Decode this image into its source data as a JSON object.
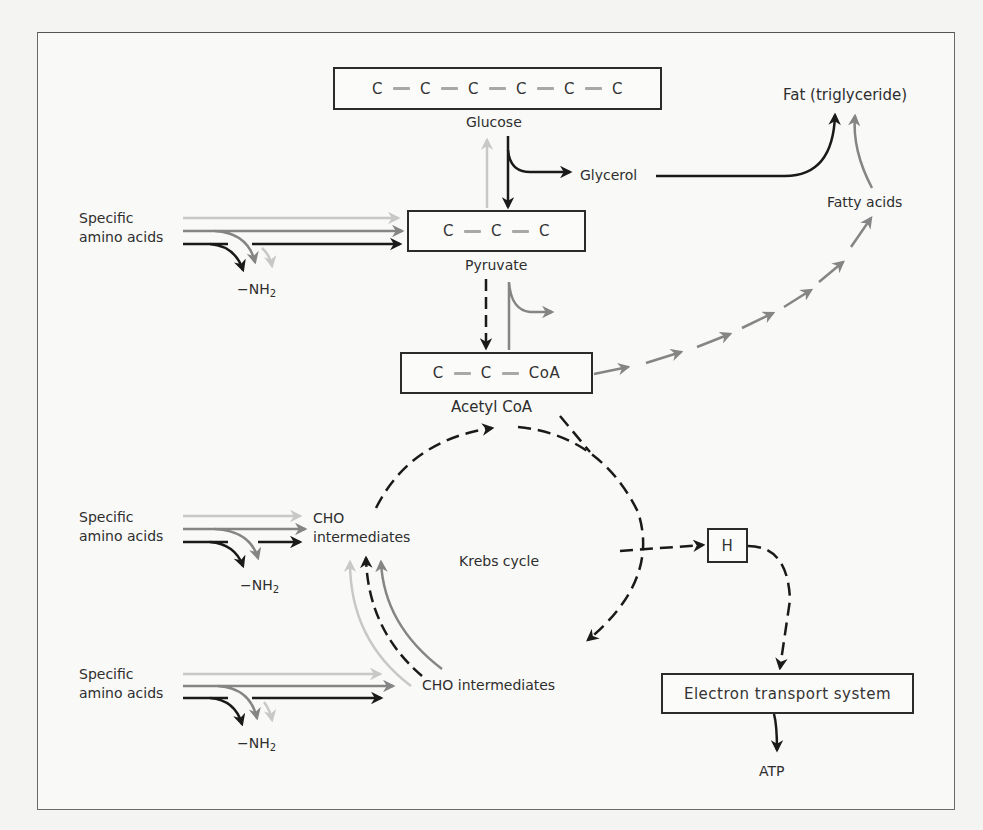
{
  "diagram": {
    "title": "",
    "nodes": {
      "glucose": {
        "label": "Glucose",
        "chain": [
          "C",
          "C",
          "C",
          "C",
          "C",
          "C"
        ]
      },
      "pyruvate": {
        "label": "Pyruvate",
        "chain": [
          "C",
          "C",
          "C"
        ]
      },
      "acetyl_coa": {
        "label": "Acetyl CoA",
        "chain": [
          "C",
          "C",
          "CoA"
        ]
      },
      "glycerol": {
        "label": "Glycerol"
      },
      "fat": {
        "label": "Fat (triglyceride)"
      },
      "fatty_acids": {
        "label": "Fatty acids"
      },
      "krebs": {
        "label": "Krebs cycle"
      },
      "cho_intermediates_upper": {
        "line1": "CHO",
        "line2": "intermediates"
      },
      "cho_intermediates_lower": {
        "label": "CHO intermediates"
      },
      "hydrogen": {
        "label": "H"
      },
      "ets": {
        "label": "Electron transport system"
      },
      "atp": {
        "label": "ATP"
      }
    },
    "amino_inputs": [
      {
        "line1": "Specific",
        "line2": "amino acids",
        "deamination": "−NH",
        "subscript": "2",
        "target": "Pyruvate"
      },
      {
        "line1": "Specific",
        "line2": "amino acids",
        "deamination": "−NH",
        "subscript": "2",
        "target": "CHO intermediates"
      },
      {
        "line1": "Specific",
        "line2": "amino acids",
        "deamination": "−NH",
        "subscript": "2",
        "target": "CHO intermediates"
      }
    ],
    "colors": {
      "black_path": "#1a1a1a",
      "dark_gray_path": "#858585",
      "light_gray_path": "#c8c8c8",
      "bond": "#a8a8a8"
    }
  }
}
